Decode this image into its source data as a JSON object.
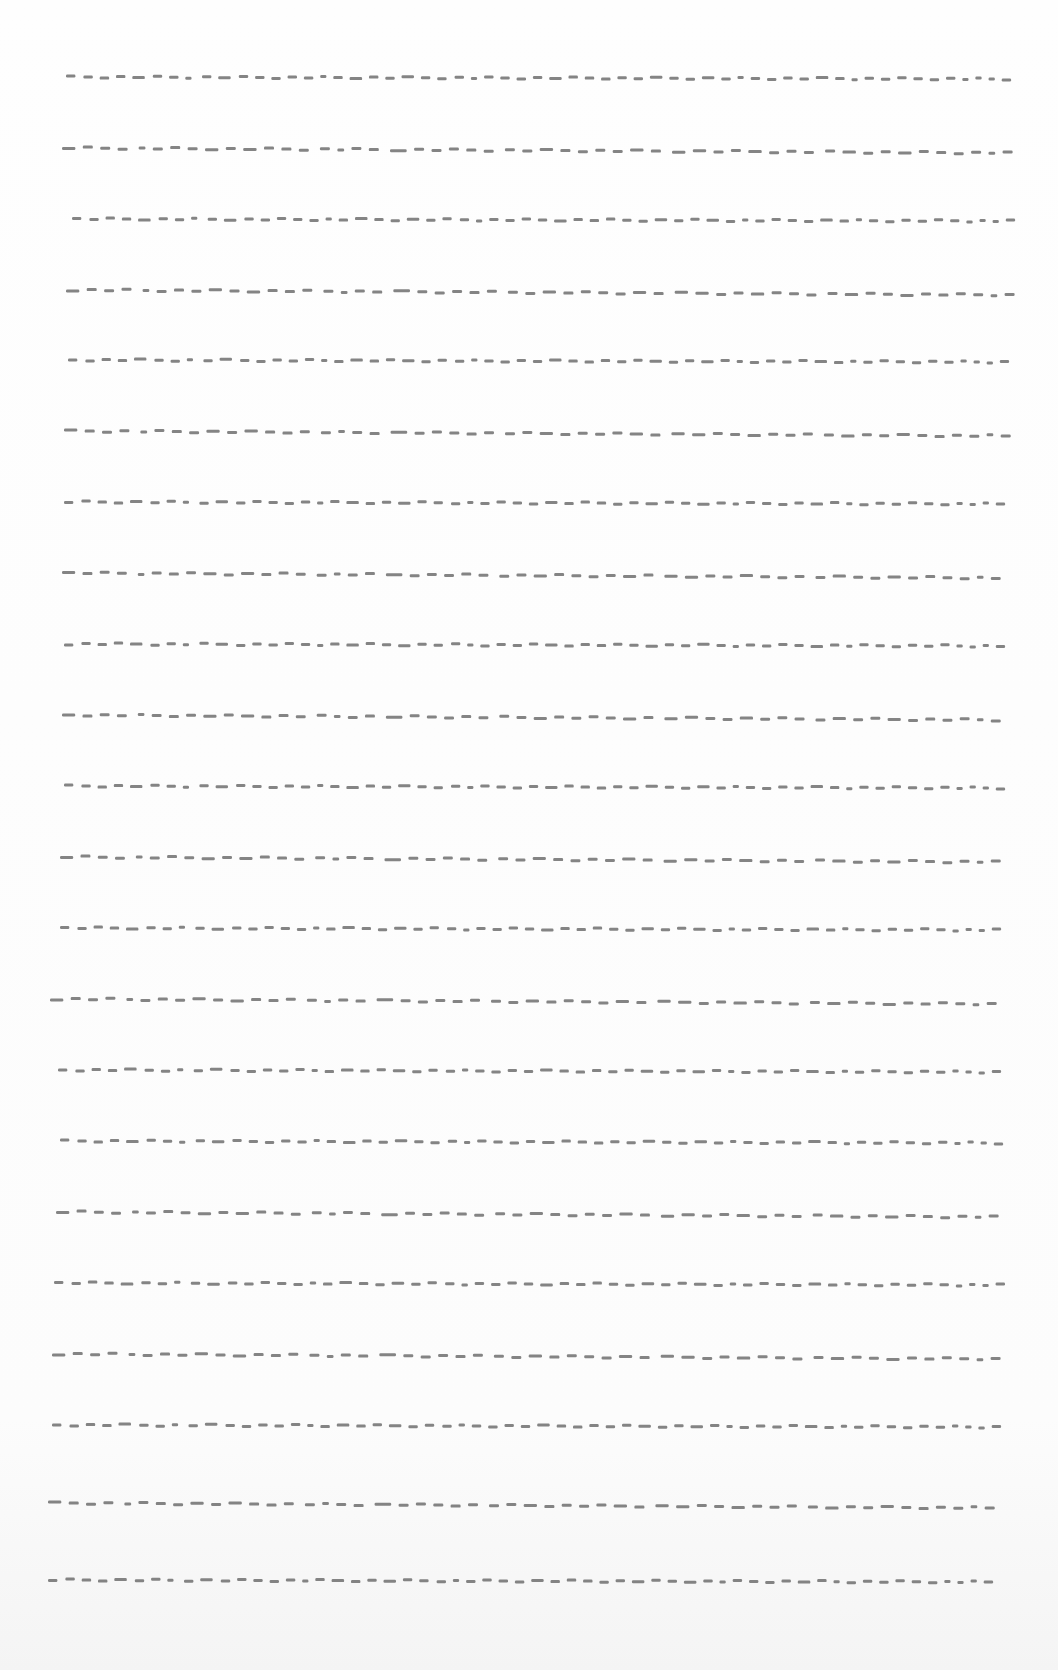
{
  "page": {
    "width": 1058,
    "height": 1670,
    "background": "#fdfdfd",
    "line_color": "#6f6f6f",
    "row_count": 22
  },
  "rows": [
    {
      "y": 77,
      "x0": 66,
      "x1": 1018,
      "pattern": "A",
      "slope": 2
    },
    {
      "y": 148,
      "x0": 62,
      "x1": 1020,
      "pattern": "B",
      "slope": 5
    },
    {
      "y": 219,
      "x0": 72,
      "x1": 1022,
      "pattern": "A",
      "slope": 2
    },
    {
      "y": 290,
      "x0": 66,
      "x1": 1022,
      "pattern": "B",
      "slope": 5
    },
    {
      "y": 360,
      "x0": 68,
      "x1": 1016,
      "pattern": "A",
      "slope": 2
    },
    {
      "y": 431,
      "x0": 64,
      "x1": 1018,
      "pattern": "B",
      "slope": 5
    },
    {
      "y": 502,
      "x0": 64,
      "x1": 1012,
      "pattern": "A",
      "slope": 2
    },
    {
      "y": 573,
      "x0": 62,
      "x1": 1008,
      "pattern": "B",
      "slope": 5
    },
    {
      "y": 644,
      "x0": 64,
      "x1": 1012,
      "pattern": "A",
      "slope": 2
    },
    {
      "y": 715,
      "x0": 62,
      "x1": 1008,
      "pattern": "B",
      "slope": 5
    },
    {
      "y": 786,
      "x0": 64,
      "x1": 1012,
      "pattern": "A",
      "slope": 2
    },
    {
      "y": 857,
      "x0": 60,
      "x1": 1008,
      "pattern": "B",
      "slope": 5
    },
    {
      "y": 928,
      "x0": 60,
      "x1": 1008,
      "pattern": "A",
      "slope": 2
    },
    {
      "y": 999,
      "x0": 50,
      "x1": 1004,
      "pattern": "B",
      "slope": 5
    },
    {
      "y": 1070,
      "x0": 58,
      "x1": 1008,
      "pattern": "A",
      "slope": 2
    },
    {
      "y": 1141,
      "x0": 60,
      "x1": 1010,
      "pattern": "A",
      "slope": 2
    },
    {
      "y": 1212,
      "x0": 56,
      "x1": 1006,
      "pattern": "B",
      "slope": 5
    },
    {
      "y": 1283,
      "x0": 54,
      "x1": 1012,
      "pattern": "A",
      "slope": 2
    },
    {
      "y": 1354,
      "x0": 52,
      "x1": 1008,
      "pattern": "B",
      "slope": 5
    },
    {
      "y": 1425,
      "x0": 52,
      "x1": 1008,
      "pattern": "A",
      "slope": 2
    },
    {
      "y": 1503,
      "x0": 48,
      "x1": 1002,
      "pattern": "B",
      "slope": 5
    },
    {
      "y": 1580,
      "x0": 48,
      "x1": 1000,
      "pattern": "A",
      "slope": 2
    }
  ],
  "patterns": {
    "A": [
      3,
      3,
      3,
      3,
      4,
      3,
      3,
      2,
      3,
      4,
      3,
      3,
      3,
      3,
      3,
      2,
      3,
      4,
      3,
      3,
      4,
      3,
      3,
      3,
      2,
      3,
      3,
      3,
      3,
      4,
      3,
      3,
      3,
      3,
      3,
      4,
      3,
      3,
      4,
      3,
      2,
      3,
      3,
      3,
      3,
      4,
      3,
      2,
      3,
      3,
      3,
      3,
      3,
      3,
      2,
      2,
      2,
      3
    ],
    "B": [
      4,
      3,
      3,
      3,
      2,
      3,
      3,
      3,
      4,
      3,
      4,
      3,
      3,
      3,
      3,
      2,
      3,
      3,
      5,
      3,
      3,
      3,
      3,
      3,
      3,
      3,
      4,
      3,
      3,
      3,
      3,
      4,
      3,
      4,
      4,
      3,
      3,
      4,
      3,
      3,
      3,
      3,
      4,
      3,
      3,
      4,
      3,
      3,
      3,
      3,
      2,
      3
    ],
    "A_gaps": [
      7,
      6,
      6,
      6,
      7,
      6,
      6,
      9,
      6,
      7,
      6,
      6,
      6,
      6,
      6,
      6,
      6,
      6,
      6,
      6,
      6,
      6,
      7,
      6,
      6,
      6,
      6,
      6,
      6,
      6,
      6,
      6,
      6,
      6,
      6,
      6,
      6,
      6,
      6,
      6,
      6,
      6,
      6,
      6,
      6,
      6,
      6,
      6,
      6,
      6,
      6,
      6,
      6,
      6,
      6,
      6,
      6
    ],
    "B_gaps": [
      6,
      6,
      6,
      9,
      6,
      6,
      6,
      6,
      6,
      6,
      6,
      6,
      6,
      9,
      6,
      6,
      6,
      9,
      6,
      6,
      6,
      6,
      6,
      9,
      6,
      6,
      6,
      6,
      6,
      6,
      6,
      6,
      9,
      6,
      6,
      6,
      6,
      6,
      6,
      6,
      9,
      6,
      6,
      6,
      6,
      6,
      6,
      6,
      6,
      6,
      6
    ]
  }
}
